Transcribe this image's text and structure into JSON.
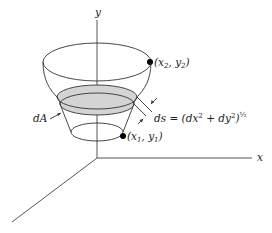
{
  "diagram": {
    "type": "surface-of-revolution",
    "axes": {
      "y_label": "y",
      "x_label": "x"
    },
    "points": {
      "upper": {
        "label_open": "(x",
        "sub1": "2",
        "label_mid": ", y",
        "sub2": "2",
        "label_close": ")"
      },
      "lower": {
        "label_open": "(x",
        "sub1": "1",
        "label_mid": ", y",
        "sub2": "1",
        "label_close": ")"
      }
    },
    "area_label": "dA",
    "arc_length": {
      "lhs": "ds",
      "eq": " = (dx",
      "sup1": "2",
      "plus": " + dy",
      "sup2": "2",
      "close": ")",
      "exp": "½"
    },
    "colors": {
      "line": "#333333",
      "band_fill": "#d4d4d4",
      "dot": "#000000"
    }
  }
}
